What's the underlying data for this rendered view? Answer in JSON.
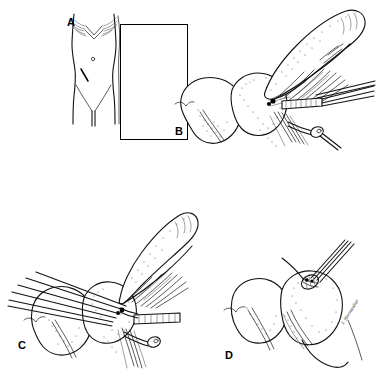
{
  "figure": {
    "background_color": "#ffffff",
    "ink_color": "#000000",
    "width": 376,
    "height": 378
  },
  "panels": [
    {
      "id": "a",
      "label": "A",
      "caption": "Anterior abdominal wall with McBurney incision site marked in the right lower quadrant",
      "framed": true,
      "subject": "female-torso",
      "features": [
        "clavicles",
        "breast-contours",
        "umbilicus",
        "oblique-incision-line",
        "inguinal-folds",
        "pubic-cleft"
      ]
    },
    {
      "id": "b",
      "label": "B",
      "caption": "Appendix elevated; mesoappendix grasped between clamp jaws prior to division",
      "framed": false,
      "subject": "appendix-mesoappendix-clamped",
      "features": [
        "cecum",
        "appendix",
        "mesoappendix",
        "appendicular-vessels",
        "kelly-clamp",
        "hemostat",
        "tissue-forceps"
      ]
    },
    {
      "id": "c",
      "label": "C",
      "caption": "Base of appendix crushed and ligated; clamp applied across the appendiceal base",
      "framed": false,
      "subject": "appendix-base-ligated",
      "features": [
        "cecum",
        "appendix",
        "mesoappendix-divided",
        "crushing-clamp",
        "ligature",
        "taenia-coli",
        "scissors"
      ]
    },
    {
      "id": "d",
      "label": "D",
      "caption": "Appendiceal stump inverted into the cecum with a purse-string suture",
      "framed": false,
      "subject": "cecum-purse-string-suture",
      "features": [
        "cecum",
        "appendiceal-stump",
        "purse-string-suture",
        "needle-holder",
        "taenia-coli"
      ]
    }
  ],
  "artist": {
    "signature_text": "J. Hormuzdiar",
    "location": "panel-d-lower-right"
  },
  "colors": {
    "ink": "#000000",
    "stipple": "#3c3c3c",
    "paper": "#ffffff"
  }
}
